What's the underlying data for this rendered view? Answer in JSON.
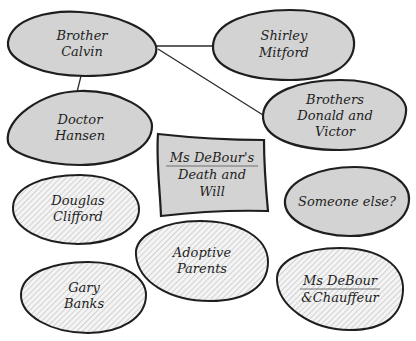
{
  "diagram": {
    "type": "mind-map",
    "colors": {
      "suspect_fill": "#d3d3d3",
      "outline": "#1e1e1e",
      "hatch_line": "#c4c4c4"
    },
    "center": {
      "id": "death-will",
      "lines": [
        "Ms DeBour's",
        "Death and",
        "Will"
      ],
      "underlined_first_line": true
    },
    "nodes": [
      {
        "id": "brother-calvin",
        "lines": [
          "Brother",
          "Calvin"
        ],
        "style": "gray"
      },
      {
        "id": "shirley-mitford",
        "lines": [
          "Shirley",
          "Mitford"
        ],
        "style": "gray"
      },
      {
        "id": "doctor-hansen",
        "lines": [
          "Doctor",
          "Hansen"
        ],
        "style": "gray"
      },
      {
        "id": "brothers-donald-victor",
        "lines": [
          "Brothers",
          "Donald and",
          "Victor"
        ],
        "style": "gray"
      },
      {
        "id": "someone-else",
        "lines": [
          "Someone else?"
        ],
        "style": "gray"
      },
      {
        "id": "douglas-clifford",
        "lines": [
          "Douglas",
          "Clifford"
        ],
        "style": "hatched"
      },
      {
        "id": "adoptive-parents",
        "lines": [
          "Adoptive",
          "Parents"
        ],
        "style": "hatched"
      },
      {
        "id": "gary-banks",
        "lines": [
          "Gary",
          "Banks"
        ],
        "style": "hatched"
      },
      {
        "id": "debour-chauffeur",
        "lines": [
          "Ms DeBour",
          "&Chauffeur"
        ],
        "style": "hatched",
        "underlined_first_line": true
      }
    ],
    "edges": [
      {
        "from": "brother-calvin",
        "to": "shirley-mitford"
      },
      {
        "from": "brother-calvin",
        "to": "brothers-donald-victor"
      },
      {
        "from": "brother-calvin",
        "to": "doctor-hansen"
      }
    ]
  }
}
